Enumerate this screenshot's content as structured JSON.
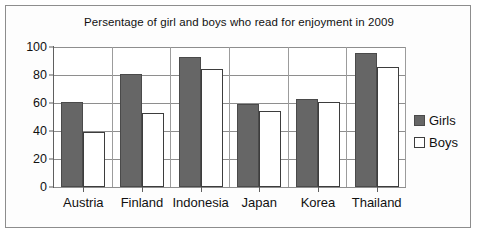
{
  "chart_data": {
    "type": "bar",
    "title": "Persentage of girl and boys who read for enjoyment in 2009",
    "xlabel": "",
    "ylabel": "",
    "ylim": [
      0,
      100
    ],
    "yticks": [
      0,
      20,
      40,
      60,
      80,
      100
    ],
    "grid": true,
    "legend_position": "right",
    "categories": [
      "Austria",
      "Finland",
      "Indonesia",
      "Japan",
      "Korea",
      "Thailand"
    ],
    "series": [
      {
        "name": "Girls",
        "color": "#666666",
        "values": [
          61,
          81,
          93,
          59,
          63,
          96
        ]
      },
      {
        "name": "Boys",
        "color": "#ffffff",
        "values": [
          39,
          53,
          84,
          54,
          61,
          86
        ]
      }
    ]
  }
}
